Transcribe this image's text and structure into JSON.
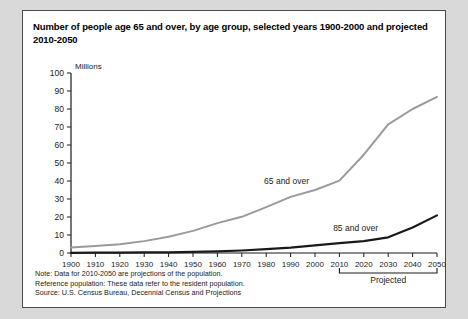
{
  "panel": {
    "title": "Number of people age 65 and over, by age group, selected years 1900-2000 and projected 2010-2050"
  },
  "footnotes": {
    "note": "Note: Data for 2010-2050 are projections of the population.",
    "reference": "Reference population: These data refer to the resident population.",
    "source": "Source: U.S. Census Bureau, Decennial Census and Projections"
  },
  "annotations": {
    "projected_label": "Projected"
  },
  "colors": {
    "series_65": "#9a9a9a",
    "series_85": "#1a1a1a",
    "axis": "#1a1a1a",
    "panel_border": "#4a4a4a",
    "page_background": "#d9d9d9"
  },
  "chart_data": {
    "type": "line",
    "title": "Number of people age 65 and over, by age group, selected years 1900-2000 and projected 2010-2050",
    "xlabel": "",
    "ylabel": "Millions",
    "ylim": [
      0,
      100
    ],
    "ytick_step": 10,
    "yticks": [
      0,
      10,
      20,
      30,
      40,
      50,
      60,
      70,
      80,
      90,
      100
    ],
    "xlim": [
      1900,
      2050
    ],
    "grid": false,
    "legend": "inline-labels",
    "categories": [
      1900,
      1910,
      1920,
      1930,
      1940,
      1950,
      1960,
      1970,
      1980,
      1990,
      2000,
      2010,
      2020,
      2030,
      2040,
      2050
    ],
    "projection_start": 2010,
    "series": [
      {
        "name": "65 and over",
        "color": "#9a9a9a",
        "label_x": 2000,
        "values": [
          3.1,
          3.9,
          4.9,
          6.6,
          9.0,
          12.3,
          16.6,
          20.1,
          25.5,
          31.2,
          35.0,
          40.2,
          54.6,
          71.5,
          80.0,
          86.7
        ]
      },
      {
        "name": "85 and over",
        "color": "#1a1a1a",
        "label_x": 2015,
        "values": [
          0.1,
          0.2,
          0.2,
          0.3,
          0.4,
          0.6,
          0.9,
          1.4,
          2.2,
          3.0,
          4.2,
          5.5,
          6.6,
          8.7,
          14.2,
          20.9
        ]
      }
    ]
  }
}
